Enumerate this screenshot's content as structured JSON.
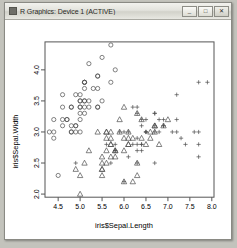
{
  "window": {
    "title": "R Graphics: Device 1 (ACTIVE)",
    "icon": "r-graphics-icon",
    "controls": {
      "minimize": "_",
      "maximize": "□",
      "close": "✕"
    }
  },
  "chart_data": {
    "type": "scatter",
    "title": "",
    "xlabel": "iris$Sepal.Length",
    "ylabel": "iris$Sepal.Width",
    "xlim": [
      4.2,
      8.05
    ],
    "ylim": [
      1.95,
      4.45
    ],
    "xticks": [
      "4.5",
      "5.0",
      "5.5",
      "6.0",
      "6.5",
      "7.0",
      "7.5",
      "8.0"
    ],
    "xtick_values": [
      4.5,
      5.0,
      5.5,
      6.0,
      6.5,
      7.0,
      7.5,
      8.0
    ],
    "yticks": [
      "2.0",
      "2.5",
      "3.0",
      "3.5",
      "4.0"
    ],
    "ytick_values": [
      2.0,
      2.5,
      3.0,
      3.5,
      4.0
    ],
    "grid": false,
    "legend": null,
    "box": true,
    "point_color": "#4d4d4d",
    "series": [
      {
        "name": "setosa",
        "glyph": "circle",
        "pch": 1,
        "x": [
          5.1,
          4.9,
          4.7,
          4.6,
          5.0,
          5.4,
          4.6,
          5.0,
          4.4,
          4.9,
          5.4,
          4.8,
          4.8,
          4.3,
          5.8,
          5.7,
          5.4,
          5.1,
          5.7,
          5.1,
          5.4,
          5.1,
          4.6,
          5.1,
          4.8,
          5.0,
          5.0,
          5.2,
          5.2,
          4.7,
          4.8,
          5.4,
          5.2,
          5.5,
          4.9,
          5.0,
          5.5,
          4.9,
          4.4,
          5.1,
          5.0,
          4.5,
          4.4,
          5.0,
          5.1,
          4.8,
          5.1,
          4.6,
          5.3,
          5.0
        ],
        "y": [
          3.5,
          3.0,
          3.2,
          3.1,
          3.6,
          3.9,
          3.4,
          3.4,
          2.9,
          3.1,
          3.7,
          3.4,
          3.0,
          3.0,
          4.0,
          4.4,
          3.9,
          3.5,
          3.8,
          3.8,
          3.4,
          3.7,
          3.6,
          3.3,
          3.4,
          3.0,
          3.4,
          3.5,
          3.4,
          3.2,
          3.1,
          3.4,
          4.1,
          4.2,
          3.1,
          3.2,
          3.5,
          3.6,
          3.0,
          3.4,
          3.5,
          2.3,
          3.2,
          3.5,
          3.8,
          3.0,
          3.8,
          3.2,
          3.7,
          3.3
        ]
      },
      {
        "name": "versicolor",
        "glyph": "triangle",
        "pch": 2,
        "x": [
          7.0,
          6.4,
          6.9,
          5.5,
          6.5,
          5.7,
          6.3,
          4.9,
          6.6,
          5.2,
          5.0,
          5.9,
          6.0,
          6.1,
          5.6,
          6.7,
          5.6,
          5.8,
          6.2,
          5.6,
          5.9,
          6.1,
          6.3,
          6.1,
          6.4,
          6.6,
          6.8,
          6.7,
          6.0,
          5.7,
          5.5,
          5.5,
          5.8,
          6.0,
          5.4,
          6.0,
          6.7,
          6.3,
          5.6,
          5.5,
          5.5,
          6.1,
          5.8,
          5.0,
          5.6,
          5.7,
          5.7,
          6.2,
          5.1,
          5.7
        ],
        "y": [
          3.2,
          3.2,
          3.1,
          2.3,
          2.8,
          2.8,
          3.3,
          2.4,
          2.9,
          2.7,
          2.0,
          3.0,
          2.2,
          2.9,
          2.9,
          3.1,
          3.0,
          2.7,
          2.2,
          2.5,
          3.2,
          2.8,
          2.5,
          2.8,
          2.9,
          3.0,
          2.8,
          3.0,
          2.9,
          2.6,
          2.4,
          2.4,
          2.7,
          2.7,
          3.0,
          3.4,
          3.1,
          2.3,
          3.0,
          2.5,
          2.6,
          3.0,
          2.6,
          2.3,
          2.7,
          3.0,
          2.9,
          2.9,
          2.5,
          2.8
        ]
      },
      {
        "name": "virginica",
        "glyph": "plus",
        "pch": 3,
        "x": [
          6.3,
          5.8,
          7.1,
          6.3,
          6.5,
          7.6,
          4.9,
          7.3,
          6.7,
          7.2,
          6.5,
          6.4,
          6.8,
          5.7,
          5.8,
          6.4,
          6.5,
          7.7,
          7.7,
          6.0,
          6.9,
          5.6,
          7.7,
          6.3,
          6.7,
          7.2,
          6.2,
          6.1,
          6.4,
          7.2,
          7.4,
          7.9,
          6.4,
          6.3,
          6.1,
          7.7,
          6.3,
          6.4,
          6.0,
          6.9,
          6.7,
          6.9,
          5.8,
          6.8,
          6.7,
          6.7,
          6.3,
          6.5,
          6.2,
          5.9
        ],
        "y": [
          3.3,
          2.7,
          3.0,
          2.9,
          3.0,
          3.0,
          2.5,
          2.9,
          2.5,
          3.6,
          3.2,
          2.7,
          3.0,
          2.5,
          2.8,
          3.2,
          3.0,
          3.8,
          2.6,
          2.2,
          3.2,
          2.8,
          2.8,
          2.7,
          3.3,
          3.2,
          2.8,
          3.0,
          2.8,
          3.0,
          2.8,
          3.8,
          2.8,
          2.8,
          2.6,
          3.0,
          3.4,
          3.1,
          3.0,
          3.1,
          3.1,
          3.1,
          2.7,
          3.2,
          3.3,
          3.0,
          2.5,
          3.0,
          3.4,
          3.0
        ]
      }
    ]
  }
}
